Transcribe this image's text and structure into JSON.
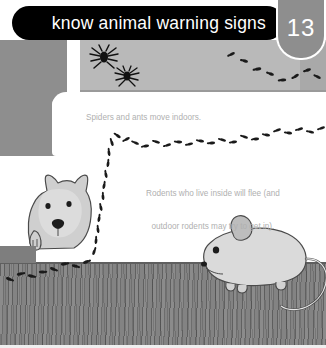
{
  "header": {
    "title": "know animal warning signs",
    "page_number": "13",
    "bar_color": "#000000",
    "badge_color": "#8e8e8e",
    "title_color": "#ffffff"
  },
  "captions": {
    "spiders": "Spiders and ants move indoors.",
    "rodents_line1": "Rodents who live inside will flee (and",
    "rodents_line2": "outdoor rodents may try to get in).",
    "text_color": "#b0b0b0"
  },
  "illustration": {
    "wall_left_color": "#8e8e8e",
    "wall_upper_color": "#b9b9b9",
    "molding_color": "#ffffff",
    "floor_color": "#7e7e7e",
    "ant_color": "#1a1a1a",
    "spider_color": "#111111",
    "mouse_body_color": "#d9d9d9",
    "mouse_outline_color": "#4a4a4a",
    "dog_body_color": "#cfcfcf",
    "dog_outline_color": "#4a4a4a",
    "elements": [
      "spider-large",
      "spider-small",
      "ant-trail-upper",
      "ant-trail-middle",
      "ant-trail-floor",
      "dog-peeking",
      "mouse"
    ]
  }
}
